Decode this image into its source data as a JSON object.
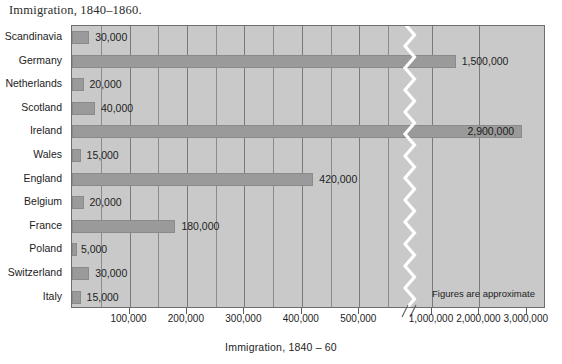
{
  "chart_data": {
    "type": "bar",
    "orientation": "horizontal",
    "title": "Immigration, 1840–1860.",
    "xlabel": "Immigration, 1840 – 60",
    "ylabel": "",
    "note": "Figures are approximate",
    "grid": true,
    "legend": "none",
    "axis_break": {
      "present": true,
      "style": "zigzag",
      "after": 550000,
      "before": 900000
    },
    "xlim": [
      0,
      3000000
    ],
    "xtick_labels": [
      "100,000",
      "200,000",
      "300,000",
      "400,000",
      "500,000",
      "1,000,000",
      "2,000,000",
      "3,000,000"
    ],
    "xtick_values": [
      100000,
      200000,
      300000,
      400000,
      500000,
      1000000,
      2000000,
      3000000
    ],
    "categories": [
      "Scandinavia",
      "Germany",
      "Netherlands",
      "Scotland",
      "Ireland",
      "Wales",
      "England",
      "Belgium",
      "France",
      "Poland",
      "Switzerland",
      "Italy"
    ],
    "values": [
      30000,
      1500000,
      20000,
      40000,
      2900000,
      15000,
      420000,
      20000,
      180000,
      5000,
      30000,
      15000
    ],
    "value_labels": [
      "30,000",
      "1,500,000",
      "20,000",
      "40,000",
      "2,900,000",
      "15,000",
      "420,000",
      "20,000",
      "180,000",
      "5,000",
      "30,000",
      "15,000"
    ],
    "bars": [
      {
        "category": "Scandinavia",
        "value": 30000,
        "label": "30,000",
        "label_inside": false
      },
      {
        "category": "Germany",
        "value": 1500000,
        "label": "1,500,000",
        "label_inside": false
      },
      {
        "category": "Netherlands",
        "value": 20000,
        "label": "20,000",
        "label_inside": false
      },
      {
        "category": "Scotland",
        "value": 40000,
        "label": "40,000",
        "label_inside": false
      },
      {
        "category": "Ireland",
        "value": 2900000,
        "label": "2,900,000",
        "label_inside": true
      },
      {
        "category": "Wales",
        "value": 15000,
        "label": "15,000",
        "label_inside": false
      },
      {
        "category": "England",
        "value": 420000,
        "label": "420,000",
        "label_inside": false
      },
      {
        "category": "Belgium",
        "value": 20000,
        "label": "20,000",
        "label_inside": false
      },
      {
        "category": "France",
        "value": 180000,
        "label": "180,000",
        "label_inside": false
      },
      {
        "category": "Poland",
        "value": 5000,
        "label": "5,000",
        "label_inside": false
      },
      {
        "category": "Switzerland",
        "value": 30000,
        "label": "30,000",
        "label_inside": false
      },
      {
        "category": "Italy",
        "value": 15000,
        "label": "15,000",
        "label_inside": false
      }
    ],
    "colors": {
      "bar_fill": "#9a9a9a",
      "bar_stroke": "#8a8a8a",
      "plot_background": "#c9c9c9",
      "gridline": "#8b8b8b",
      "axis": "#6e6e6e",
      "text": "#1d1d1d",
      "page_background": "#ffffff",
      "break_line": "#ffffff"
    }
  }
}
